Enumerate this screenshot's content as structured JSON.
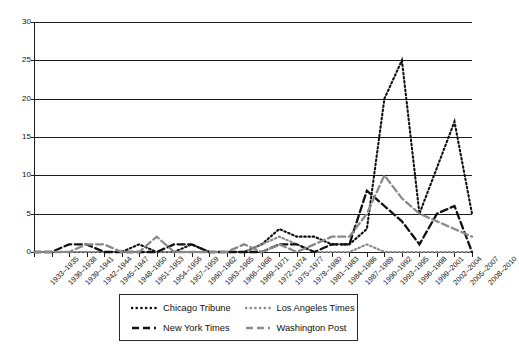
{
  "chart_data": {
    "type": "line",
    "title": "",
    "xlabel": "",
    "ylabel": "",
    "ylim": [
      0,
      30
    ],
    "yticks": [
      0,
      5,
      10,
      15,
      20,
      25,
      30
    ],
    "grid": true,
    "legend_position": "bottom",
    "categories": [
      "1933–1935",
      "1936–1938",
      "1939–1941",
      "1942–1944",
      "1945–1947",
      "1948–1950",
      "1951–1953",
      "1954–1956",
      "1957–1959",
      "1960–1962",
      "1963–1965",
      "1966–1968",
      "1969–1971",
      "1972–1974",
      "1975–1977",
      "1978–1980",
      "1981–1983",
      "1984–1986",
      "1987–1989",
      "1990–1992",
      "1993–1995",
      "1996–1998",
      "1999–2001",
      "2002–2004",
      "2005–2007",
      "2008–2010"
    ],
    "series": [
      {
        "name": "Chicago Tribune",
        "color": "#111111",
        "style": "dotted",
        "values": [
          0,
          0,
          0,
          0,
          0,
          0,
          1,
          0,
          0,
          1,
          0,
          0,
          0,
          1,
          3,
          2,
          2,
          1,
          1,
          3,
          20,
          25,
          5,
          11,
          17,
          5
        ]
      },
      {
        "name": "Los Angeles Times",
        "color": "#8a8a8a",
        "style": "dotted",
        "values": [
          0,
          0,
          0,
          0,
          0,
          0,
          0,
          0,
          0,
          0,
          0,
          0,
          0,
          1,
          2,
          1,
          0,
          0,
          0,
          1,
          0,
          0,
          0,
          0,
          0,
          0
        ]
      },
      {
        "name": "New York Times",
        "color": "#111111",
        "style": "dashed",
        "values": [
          0,
          0,
          1,
          1,
          0,
          0,
          0,
          0,
          1,
          1,
          0,
          0,
          0,
          0,
          1,
          1,
          0,
          1,
          1,
          8,
          6,
          4,
          1,
          5,
          6,
          0
        ]
      },
      {
        "name": "Washington Post",
        "color": "#8a8a8a",
        "style": "dashed",
        "values": [
          0,
          0,
          0,
          1,
          1,
          0,
          0,
          2,
          0,
          0,
          0,
          0,
          1,
          0,
          1,
          0,
          1,
          2,
          2,
          5,
          10,
          7,
          5,
          4,
          3,
          2
        ]
      }
    ]
  },
  "legend": {
    "items": [
      {
        "label": "Chicago Tribune",
        "series": 0
      },
      {
        "label": "Los Angeles Times",
        "series": 1
      },
      {
        "label": "New York Times",
        "series": 2
      },
      {
        "label": "Washington Post",
        "series": 3
      }
    ]
  },
  "colors": {
    "axis": "#1d1d1d",
    "grid": "#1d1d1d",
    "dark_series": "#111111",
    "light_series": "#8a8a8a",
    "background": "#ffffff"
  }
}
